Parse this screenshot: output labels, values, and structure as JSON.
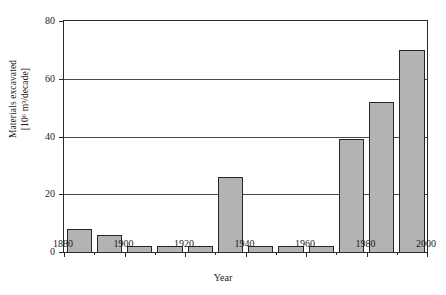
{
  "chart_data": {
    "type": "bar",
    "title": "",
    "xlabel": "Year",
    "ylabel_line1": "Materials excavated",
    "ylabel_line2": "[10⁶ m³/decade]",
    "categories": [
      1880,
      1890,
      1900,
      1910,
      1920,
      1930,
      1940,
      1950,
      1960,
      1970,
      1980,
      1990
    ],
    "values": [
      8,
      6,
      2,
      2,
      2,
      26,
      2,
      2,
      2,
      39,
      52,
      70
    ],
    "bar_width_years": 10,
    "xlim": [
      1880,
      2000
    ],
    "ylim": [
      0,
      80
    ],
    "xticks": [
      1880,
      1900,
      1920,
      1940,
      1960,
      1980,
      2000
    ],
    "xticklabels": [
      "1880",
      "1900",
      "1920",
      "1940",
      "1960",
      "1980",
      "2000"
    ],
    "xticks_minor": [
      1890,
      1910,
      1930,
      1950,
      1970,
      1990
    ],
    "yticks": [
      0,
      20,
      40,
      60,
      80
    ],
    "yticklabels": [
      "0",
      "20",
      "40",
      "60",
      "80"
    ],
    "grid": "horizontal",
    "legend": "none",
    "bar_fill_color": "#b3b3b3",
    "bar_edge_color": "#262626",
    "axis_color": "#2b2b2b",
    "gridline_color": "#4a4a4a",
    "background_color": "#ffffff"
  }
}
